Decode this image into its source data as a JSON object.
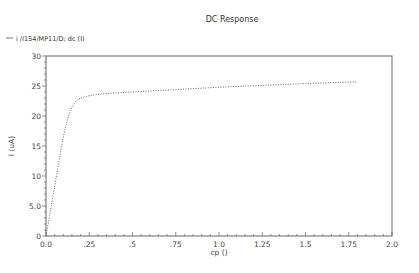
{
  "chart_data": {
    "type": "line",
    "title": "DC Response",
    "xlabel": "cp ()",
    "ylabel": "I (uA)",
    "xlim": [
      0.0,
      2.0
    ],
    "ylim": [
      0,
      30
    ],
    "grid": false,
    "legend_position": "top-left",
    "x_ticks": [
      "0.0",
      ".25",
      ".5",
      ".75",
      "1.0",
      "1.25",
      "1.5",
      "1.75",
      "2.0"
    ],
    "y_ticks": [
      "0",
      "5.0",
      "10",
      "15",
      "20",
      "25",
      "30"
    ],
    "series": [
      {
        "name": "i /I154/MP11/D; dc (I)",
        "style": "dotted",
        "color": "#555555",
        "x": [
          0.0,
          0.025,
          0.05,
          0.075,
          0.1,
          0.125,
          0.15,
          0.175,
          0.2,
          0.25,
          0.3,
          0.4,
          0.5,
          0.75,
          1.0,
          1.25,
          1.5,
          1.75,
          1.8
        ],
        "values": [
          0.0,
          4.0,
          8.2,
          12.5,
          16.5,
          19.5,
          21.5,
          22.6,
          23.0,
          23.4,
          23.6,
          23.85,
          24.0,
          24.4,
          24.8,
          25.1,
          25.4,
          25.65,
          25.7
        ]
      }
    ]
  },
  "header": {
    "title": "DC Response",
    "legend_label": "i /I154/MP11/D; dc (I)"
  },
  "axes": {
    "x_label": "cp ()",
    "y_label": "I (uA)"
  }
}
